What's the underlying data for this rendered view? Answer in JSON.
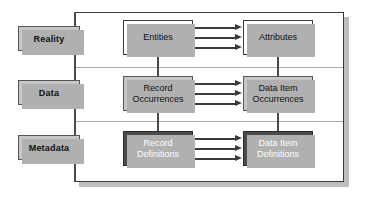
{
  "diagram": {
    "colors": {
      "frame_border": "#3a3a3a",
      "band_divider": "#a9a9a9",
      "label_fill": "#c6c6c6",
      "node_white_fill": "#ffffff",
      "node_gray_fill": "#c6c6c6",
      "node_dark_fill": "#4a4a4a",
      "node_dark_text": "#ffffff",
      "shadow": "#b0b0b0",
      "arrow": "#3a3a3a"
    },
    "side_labels": [
      {
        "id": "reality",
        "label": "Reality"
      },
      {
        "id": "data",
        "label": "Data"
      },
      {
        "id": "metadata",
        "label": "Metadata"
      }
    ],
    "rows": [
      {
        "id": "reality",
        "band_label": "Reality",
        "style": "white",
        "left_node": "Entities",
        "right_node": "Attributes",
        "arrow_count": 3
      },
      {
        "id": "data",
        "band_label": "Data",
        "style": "gray",
        "left_node": "Record\nOccurrences",
        "right_node": "Data Item\nOccurrences",
        "arrow_count": 3
      },
      {
        "id": "metadata",
        "band_label": "Metadata",
        "style": "dark",
        "left_node": "Record\nDefinitions",
        "right_node": "Data Item\nDefinitions",
        "arrow_count": 3
      }
    ],
    "nodes": {
      "entities": "Entities",
      "attributes": "Attributes",
      "record_occurrences": "Record\nOccurrences",
      "data_item_occurrences": "Data Item\nOccurrences",
      "record_definitions": "Record\nDefinitions",
      "data_item_definitions": "Data Item\nDefinitions"
    }
  }
}
